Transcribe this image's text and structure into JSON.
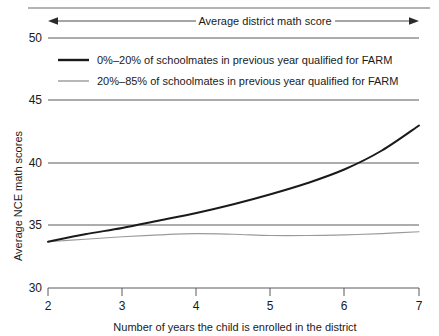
{
  "chart_data": {
    "type": "line",
    "title": "",
    "annotation": "Average district math score",
    "xlabel": "Number of years the child is enrolled in the district",
    "ylabel": "Average NCE math scores",
    "xlim": [
      2,
      7
    ],
    "ylim": [
      30,
      50
    ],
    "xticks": [
      2,
      3,
      4,
      5,
      6,
      7
    ],
    "xtick_labels": [
      "2",
      "3",
      "4",
      "5",
      "6",
      "7"
    ],
    "yticks": [
      30,
      35,
      40,
      45,
      50
    ],
    "ytick_labels": [
      "30",
      "35",
      "40",
      "45",
      "50"
    ],
    "grid": true,
    "grid_axis": "y",
    "legend_position": "upper-left-inside",
    "x": [
      2,
      2.5,
      3,
      3.5,
      4,
      4.5,
      5,
      5.5,
      6,
      6.5,
      7
    ],
    "series": [
      {
        "name": "0%–20% of schoolmates in previous year qualified for FARM",
        "color": "#1a1a1a",
        "width": 2.0,
        "values": [
          33.7,
          34.3,
          34.8,
          35.4,
          36.0,
          36.7,
          37.5,
          38.4,
          39.5,
          41.0,
          43.0
        ]
      },
      {
        "name": "20%–85% of schoolmates in previous year qualified for FARM",
        "color": "#9a9a9a",
        "width": 1.2,
        "values": [
          33.7,
          33.9,
          34.1,
          34.25,
          34.35,
          34.3,
          34.2,
          34.2,
          34.25,
          34.35,
          34.5
        ]
      }
    ]
  },
  "axes": {
    "y_title": "Average NCE math scores",
    "x_title": "Number of years the child is enrolled in the district",
    "y_labels": [
      "50",
      "45",
      "40",
      "35",
      "30"
    ],
    "x_labels": [
      "2",
      "3",
      "4",
      "5",
      "6",
      "7"
    ]
  },
  "annotation": {
    "text": "Average district math score",
    "arrow_style": "double-headed"
  },
  "legend": {
    "entries": [
      {
        "label": "0%–20% of schoolmates in previous year qualified for FARM",
        "swatch_color": "#1a1a1a",
        "swatch_weight": "thick"
      },
      {
        "label": "20%–85% of schoolmates in previous year qualified for FARM",
        "swatch_color": "#9a9a9a",
        "swatch_weight": "thin"
      }
    ]
  },
  "colors": {
    "series_dark": "#1a1a1a",
    "series_light": "#9a9a9a",
    "gridline": "#5a5a5a",
    "background": "#ffffff"
  }
}
